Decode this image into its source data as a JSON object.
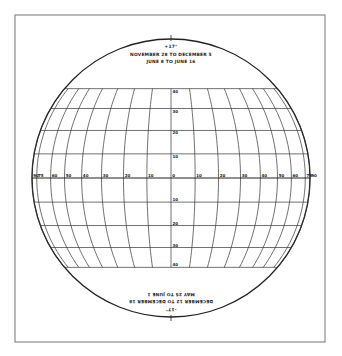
{
  "chart_data": {
    "type": "diagram",
    "top_caption": {
      "declination": "+17°",
      "line1": "NOVEMBER 28 TO DECEMBER 5",
      "line2": "JUNE 8  TO JUNE 16"
    },
    "bottom_caption": {
      "declination": "-17°",
      "line1": "MAY 25 TO JUNE 1",
      "line2": "DECEMBER 12 TO DECEMBER 18",
      "rotated": true
    },
    "longitude_labels": [
      "90",
      "75",
      "60",
      "50",
      "40",
      "30",
      "20",
      "10",
      "0",
      "10",
      "20",
      "30",
      "40",
      "50",
      "60",
      "75",
      "90"
    ],
    "longitudes": [
      -90,
      -75,
      -60,
      -50,
      -40,
      -30,
      -20,
      -10,
      0,
      10,
      20,
      30,
      40,
      50,
      60,
      75,
      90
    ],
    "latitude_labels_north": [
      "10",
      "20",
      "30",
      "40"
    ],
    "latitude_labels_south": [
      "10",
      "20",
      "30",
      "40"
    ],
    "latitudes": [
      -40,
      -30,
      -20,
      -10,
      0,
      10,
      20,
      30,
      40
    ],
    "grid_band_lat_range": [
      -40,
      40
    ]
  },
  "geometry": {
    "frame": {
      "x": 15,
      "y": 15,
      "w": 310,
      "h": 327
    },
    "center": {
      "x": 171,
      "y": 178
    },
    "radius": 139
  },
  "colors": {
    "ink": "#222222",
    "frame": "#8a8a8a",
    "background": "#ffffff"
  }
}
